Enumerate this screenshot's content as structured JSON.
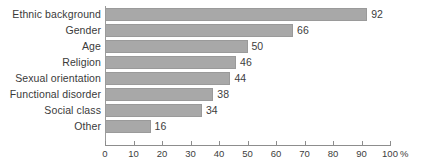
{
  "chart_data": {
    "type": "bar",
    "orientation": "horizontal",
    "title": "",
    "xlabel": "%",
    "ylabel": "",
    "xlim": [
      0,
      100
    ],
    "xticks": [
      0,
      10,
      20,
      30,
      40,
      50,
      60,
      70,
      80,
      90,
      100
    ],
    "xtick_labels": [
      "0",
      "10",
      "20",
      "30",
      "40",
      "50",
      "60",
      "70",
      "80",
      "90",
      "100"
    ],
    "axis_unit": "%",
    "grid": false,
    "legend": false,
    "bar_color": "#a8a8a8",
    "bar_border_color": "#9a9a9a",
    "text_color": "#3d3d3d",
    "axis_color": "#8d8d8d",
    "categories": [
      "Ethnic background",
      "Gender",
      "Age",
      "Religion",
      "Sexual orientation",
      "Functional disorder",
      "Social class",
      "Other"
    ],
    "values": [
      92,
      66,
      50,
      46,
      44,
      38,
      34,
      16
    ],
    "value_labels": [
      "92",
      "66",
      "50",
      "46",
      "44",
      "38",
      "34",
      "16"
    ]
  }
}
